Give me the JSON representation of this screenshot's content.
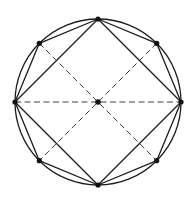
{
  "diagram": {
    "shapes": {
      "circle": {
        "label": "circumscribed circle"
      },
      "octagon": {
        "vertex_count": 8,
        "label": "inscribed regular octagon"
      },
      "square": {
        "vertex_count": 4,
        "label": "inscribed square (diamond orientation)",
        "uses_vertices": [
          0,
          2,
          4,
          6
        ]
      },
      "dashed_lines": {
        "label": "dashed segments through center",
        "segments": [
          [
            6,
            2
          ],
          [
            7,
            3
          ],
          [
            1,
            5
          ]
        ]
      }
    },
    "points": {
      "center": {
        "label": "center",
        "marked": true
      },
      "vertices_marked": 8
    },
    "colors": {
      "stroke": "#1c1c1c",
      "dash": "#2a2a2a",
      "point": "#111111",
      "background": "#ffffff"
    }
  }
}
